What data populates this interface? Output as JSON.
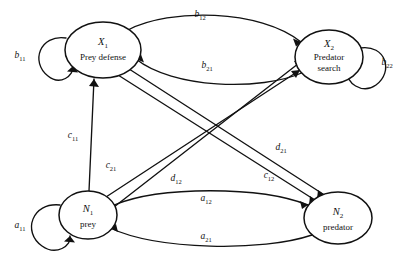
{
  "figure": {
    "kind": "signal-flow-graph",
    "background_color": "#ffffff",
    "line_color": "#111111",
    "width": 407,
    "height": 260
  },
  "nodes": [
    {
      "id": "X1",
      "symbol": "X",
      "subscript": "1",
      "name": "Prey defense",
      "cx": 103,
      "cy": 50,
      "rx": 38,
      "ry": 28
    },
    {
      "id": "X2",
      "symbol": "X",
      "subscript": "2",
      "name_line1": "Predator",
      "name_line2": "search",
      "cx": 329,
      "cy": 57,
      "rx": 34,
      "ry": 27
    },
    {
      "id": "N1",
      "symbol": "N",
      "subscript": "1",
      "name": "prey",
      "cx": 88,
      "cy": 215,
      "rx": 29,
      "ry": 24
    },
    {
      "id": "N2",
      "symbol": "N",
      "subscript": "2",
      "name": "predator",
      "cx": 338,
      "cy": 218,
      "rx": 34,
      "ry": 26
    }
  ],
  "edges": [
    {
      "id": "b11",
      "symbol": "b",
      "subscript": "11",
      "from": "X1",
      "to": "X1",
      "type": "self-loop",
      "label_x": 20,
      "label_y": 58
    },
    {
      "id": "b22",
      "symbol": "b",
      "subscript": "22",
      "from": "X2",
      "to": "X2",
      "type": "self-loop",
      "label_x": 387,
      "label_y": 65
    },
    {
      "id": "a11",
      "symbol": "a",
      "subscript": "11",
      "from": "N1",
      "to": "N1",
      "type": "self-loop",
      "label_x": 20,
      "label_y": 228
    },
    {
      "id": "b12",
      "symbol": "b",
      "subscript": "12",
      "from": "X1",
      "to": "X2",
      "type": "arc",
      "label_x": 200,
      "label_y": 17
    },
    {
      "id": "b21",
      "symbol": "b",
      "subscript": "21",
      "from": "X2",
      "to": "X1",
      "type": "arc",
      "label_x": 207,
      "label_y": 68
    },
    {
      "id": "c11",
      "symbol": "c",
      "subscript": "11",
      "from": "N1",
      "to": "X1",
      "type": "straight",
      "label_x": 73,
      "label_y": 138
    },
    {
      "id": "c21",
      "symbol": "c",
      "subscript": "21",
      "from": "N1",
      "to": "X2",
      "type": "straight",
      "label_x": 111,
      "label_y": 168
    },
    {
      "id": "d12",
      "symbol": "d",
      "subscript": "12",
      "from": "N1",
      "to": "X2",
      "type": "straight",
      "label_x": 176,
      "label_y": 181
    },
    {
      "id": "d21",
      "symbol": "d",
      "subscript": "21",
      "from": "X1",
      "to": "N2",
      "type": "straight",
      "label_x": 281,
      "label_y": 150
    },
    {
      "id": "c12",
      "symbol": "c",
      "subscript": "12",
      "from": "X1",
      "to": "N2",
      "type": "straight",
      "label_x": 269,
      "label_y": 178
    },
    {
      "id": "a12",
      "symbol": "a",
      "subscript": "12",
      "from": "N1",
      "to": "N2",
      "type": "arc",
      "label_x": 206,
      "label_y": 201
    },
    {
      "id": "a21",
      "symbol": "a",
      "subscript": "21",
      "from": "N2",
      "to": "N1",
      "type": "arc",
      "label_x": 206,
      "label_y": 239
    }
  ]
}
